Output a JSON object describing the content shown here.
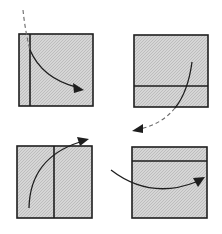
{
  "diagram": {
    "width": 222,
    "height": 234,
    "colors": {
      "background": "#ffffff",
      "panel_fill": "#d6d6d6",
      "panel_stipple": "#bdbdbd",
      "stroke": "#1e1e1e",
      "dashed": "#6a6a6a"
    },
    "panels": [
      {
        "id": "top-left",
        "box": {
          "x": 19,
          "y": 34,
          "w": 74,
          "h": 72
        },
        "fold_line": {
          "orientation": "vertical",
          "x1": 30,
          "y1": 34,
          "x2": 30,
          "y2": 106
        }
      },
      {
        "id": "top-right",
        "box": {
          "x": 134,
          "y": 35,
          "w": 74,
          "h": 72
        },
        "fold_line": {
          "orientation": "horizontal",
          "x1": 134,
          "y1": 86,
          "x2": 208,
          "y2": 86
        }
      },
      {
        "id": "bottom-left",
        "box": {
          "x": 17,
          "y": 146,
          "w": 75,
          "h": 72
        },
        "fold_line": {
          "orientation": "vertical",
          "x1": 54,
          "y1": 146,
          "x2": 54,
          "y2": 218
        }
      },
      {
        "id": "bottom-right",
        "box": {
          "x": 132,
          "y": 147,
          "w": 75,
          "h": 71
        },
        "fold_line": {
          "orientation": "horizontal",
          "x1": 132,
          "y1": 161,
          "x2": 207,
          "y2": 161
        }
      }
    ],
    "arrows": [
      {
        "id": "arrow-top-left",
        "style": "dashed-to-solid",
        "dashed_path": "M23,10 Q25,30 30,50",
        "solid_path": "M30,50 Q42,78 76,87",
        "head": "M84,90 L73,83 L74,93 Z"
      },
      {
        "id": "arrow-top-right",
        "style": "solid-to-dashed",
        "solid_path": "M192,62 Q188,92 175,108",
        "dashed_path": "M175,108 Q162,124 140,129",
        "head": "M132,131 L143,124 L143,133 Z"
      },
      {
        "id": "arrow-bottom-left",
        "style": "solid",
        "solid_path": "M29,208 Q30,158 80,142",
        "head": "M89,139 L77,137 L80,146 Z"
      },
      {
        "id": "arrow-bottom-right",
        "style": "solid",
        "solid_path": "M111,170 Q150,200 196,182",
        "head": "M205,177 L193,178 L198,187 Z"
      }
    ]
  }
}
